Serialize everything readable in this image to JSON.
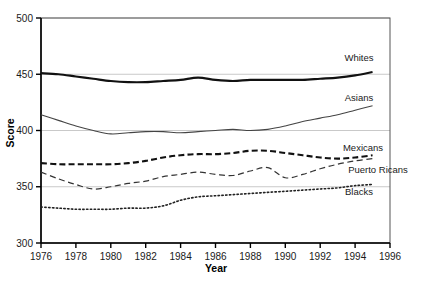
{
  "chart_data": {
    "type": "line",
    "title": "",
    "xlabel": "Year",
    "ylabel": "Score",
    "xlim": [
      1976,
      1996
    ],
    "ylim": [
      300,
      500
    ],
    "xticks": [
      1976,
      1978,
      1980,
      1982,
      1984,
      1986,
      1988,
      1990,
      1992,
      1994,
      1996
    ],
    "yticks": [
      300,
      350,
      400,
      450,
      500
    ],
    "grid": "horizontal",
    "legend_position": "inline-right",
    "x": [
      1976,
      1977,
      1978,
      1979,
      1980,
      1981,
      1982,
      1983,
      1984,
      1985,
      1986,
      1987,
      1988,
      1989,
      1990,
      1991,
      1992,
      1993,
      1994,
      1995
    ],
    "series": [
      {
        "name": "Whites",
        "style": "solid-thick",
        "color": "#111111",
        "values": [
          451,
          450,
          448,
          446,
          444,
          443,
          443,
          444,
          445,
          447,
          445,
          444,
          445,
          445,
          445,
          445,
          446,
          447,
          449,
          452
        ]
      },
      {
        "name": "Asians",
        "style": "solid-thin",
        "color": "#444444",
        "values": [
          414,
          409,
          404,
          400,
          397,
          398,
          399,
          399,
          398,
          399,
          400,
          401,
          400,
          401,
          404,
          408,
          411,
          414,
          418,
          422
        ]
      },
      {
        "name": "Mexicans",
        "style": "dashed-thick",
        "color": "#111111",
        "values": [
          371,
          370,
          370,
          370,
          370,
          371,
          373,
          376,
          378,
          379,
          379,
          380,
          382,
          382,
          380,
          378,
          376,
          375,
          376,
          378
        ]
      },
      {
        "name": "Puerto Ricans",
        "style": "dashed-thin",
        "color": "#333333",
        "values": [
          363,
          357,
          352,
          348,
          350,
          353,
          355,
          359,
          361,
          363,
          361,
          360,
          364,
          367,
          358,
          361,
          366,
          370,
          373,
          375
        ]
      },
      {
        "name": "Blacks",
        "style": "dotted",
        "color": "#222222",
        "values": [
          332,
          331,
          330,
          330,
          330,
          331,
          331,
          333,
          338,
          341,
          342,
          343,
          344,
          345,
          346,
          347,
          348,
          349,
          351,
          352
        ]
      }
    ]
  },
  "axes": {
    "y_axis_title": "Score",
    "x_axis_title": "Year",
    "y_tick_labels": [
      "500",
      "450",
      "400",
      "350",
      "300"
    ],
    "x_tick_labels": [
      "1976",
      "1978",
      "1980",
      "1982",
      "1984",
      "1986",
      "1988",
      "1990",
      "1992",
      "1994",
      "1996"
    ]
  },
  "series_labels": [
    {
      "text": "Whites"
    },
    {
      "text": "Asians"
    },
    {
      "text": "Mexicans"
    },
    {
      "text": "Puerto Ricans"
    },
    {
      "text": "Blacks"
    }
  ],
  "colors": {
    "axis": "#000000",
    "gridline": "#c9c9c9",
    "text": "#1a1a1a",
    "plot_background": "#ffffff"
  }
}
